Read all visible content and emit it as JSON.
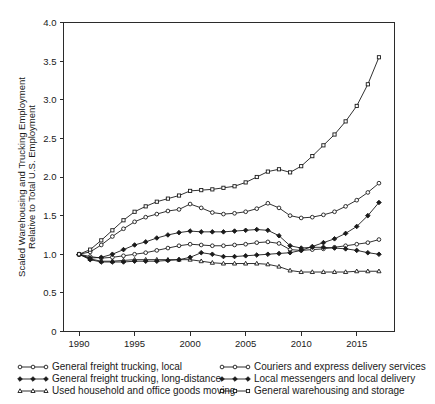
{
  "chart_data": {
    "type": "line",
    "title": "",
    "xlabel": "",
    "ylabel": "Scaled Warehousing and Trucking Employment Relative to Total U.S. Employment",
    "ylabel_line1": "Scaled Warehousing and Trucking Employment",
    "ylabel_line2": "Relative to Total U.S. Employment",
    "xlim": [
      1988.6,
      2018.4
    ],
    "ylim": [
      0,
      4.0
    ],
    "grid": false,
    "legend_position": "below-plot-two-columns",
    "y_ticks": [
      "0",
      "0.5",
      "1.0",
      "1.5",
      "2.0",
      "2.5",
      "3.0",
      "3.5",
      "4.0"
    ],
    "y_tick_values": [
      0,
      0.5,
      1.0,
      1.5,
      2.0,
      2.5,
      3.0,
      3.5,
      4.0
    ],
    "x_ticks": [
      "1990",
      "1995",
      "2000",
      "2005",
      "2010",
      "2015"
    ],
    "x_tick_values": [
      1990,
      1995,
      2000,
      2005,
      2010,
      2015
    ],
    "x": [
      1990,
      1991,
      1992,
      1993,
      1994,
      1995,
      1996,
      1997,
      1998,
      1999,
      2000,
      2001,
      2002,
      2003,
      2004,
      2005,
      2006,
      2007,
      2008,
      2009,
      2010,
      2011,
      2012,
      2013,
      2014,
      2015,
      2016,
      2017
    ],
    "series": [
      {
        "name": "General freight trucking, local",
        "marker": "open-circle",
        "marker_filled": false,
        "line_style": "solid",
        "values": [
          1.0,
          0.97,
          0.95,
          0.96,
          0.98,
          1.0,
          1.02,
          1.05,
          1.08,
          1.11,
          1.13,
          1.12,
          1.11,
          1.11,
          1.12,
          1.13,
          1.15,
          1.16,
          1.14,
          1.06,
          1.05,
          1.06,
          1.07,
          1.09,
          1.11,
          1.13,
          1.15,
          1.19
        ]
      },
      {
        "name": "General freight trucking, long-distance",
        "marker": "filled-diamond",
        "marker_filled": true,
        "line_style": "solid",
        "values": [
          1.0,
          0.95,
          0.96,
          1.0,
          1.06,
          1.12,
          1.16,
          1.21,
          1.25,
          1.28,
          1.3,
          1.29,
          1.29,
          1.29,
          1.3,
          1.31,
          1.32,
          1.31,
          1.24,
          1.11,
          1.08,
          1.09,
          1.09,
          1.08,
          1.07,
          1.05,
          1.02,
          1.0
        ]
      },
      {
        "name": "Used household and office goods moving",
        "marker": "open-triangle",
        "marker_filled": false,
        "line_style": "solid",
        "values": [
          1.0,
          0.94,
          0.91,
          0.91,
          0.92,
          0.93,
          0.93,
          0.93,
          0.93,
          0.93,
          0.93,
          0.91,
          0.89,
          0.88,
          0.88,
          0.88,
          0.88,
          0.87,
          0.84,
          0.79,
          0.77,
          0.77,
          0.77,
          0.77,
          0.77,
          0.78,
          0.78,
          0.78
        ]
      },
      {
        "name": "Couriers and express delivery services",
        "marker": "open-circle",
        "marker_filled": false,
        "line_style": "solid",
        "values": [
          1.0,
          1.03,
          1.12,
          1.23,
          1.33,
          1.42,
          1.48,
          1.52,
          1.56,
          1.58,
          1.65,
          1.6,
          1.54,
          1.52,
          1.53,
          1.55,
          1.59,
          1.66,
          1.6,
          1.5,
          1.47,
          1.48,
          1.51,
          1.55,
          1.62,
          1.7,
          1.8,
          1.92
        ]
      },
      {
        "name": "Local messengers and local delivery",
        "marker": "filled-diamond",
        "marker_filled": true,
        "line_style": "solid",
        "values": [
          1.0,
          0.93,
          0.9,
          0.9,
          0.9,
          0.91,
          0.91,
          0.91,
          0.92,
          0.93,
          0.96,
          1.02,
          1.0,
          0.97,
          0.97,
          0.98,
          0.99,
          1.0,
          1.01,
          1.02,
          1.05,
          1.1,
          1.15,
          1.2,
          1.27,
          1.36,
          1.5,
          1.67
        ]
      },
      {
        "name": "General warehousing and storage",
        "marker": "open-square",
        "marker_filled": false,
        "line_style": "solid",
        "values": [
          1.0,
          1.06,
          1.18,
          1.31,
          1.44,
          1.55,
          1.62,
          1.68,
          1.72,
          1.76,
          1.82,
          1.83,
          1.84,
          1.86,
          1.88,
          1.93,
          2.0,
          2.07,
          2.1,
          2.06,
          2.14,
          2.27,
          2.41,
          2.55,
          2.72,
          2.92,
          3.2,
          3.55
        ]
      }
    ],
    "legend": [
      {
        "label": "General freight trucking, local",
        "marker": "open-circle",
        "column": 0,
        "row": 0
      },
      {
        "label": "General freight trucking, long-distance",
        "marker": "filled-diamond",
        "column": 0,
        "row": 1
      },
      {
        "label": "Used household and office goods moving",
        "marker": "open-triangle",
        "column": 0,
        "row": 2
      },
      {
        "label": "Couriers and express delivery services",
        "marker": "open-circle",
        "column": 1,
        "row": 0
      },
      {
        "label": "Local messengers and local delivery",
        "marker": "filled-diamond",
        "column": 1,
        "row": 1
      },
      {
        "label": "General warehousing and storage",
        "marker": "open-square",
        "column": 1,
        "row": 2
      }
    ],
    "colors": {
      "line": "#1a1a1a",
      "marker_fill_open": "#ffffff",
      "marker_fill_solid": "#1a1a1a",
      "axis": "#2b2b2b",
      "background": "#ffffff"
    }
  }
}
